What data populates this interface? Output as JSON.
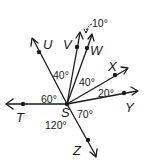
{
  "diagram": {
    "type": "angles-from-common-vertex",
    "vertex": {
      "label": "S",
      "x": 67,
      "y": 104
    },
    "rays": [
      {
        "name": "T",
        "dot": [
          23,
          104
        ],
        "tip": [
          6,
          104
        ],
        "label_pos": [
          17,
          122
        ]
      },
      {
        "name": "U",
        "dot": [
          39,
          52
        ],
        "tip": [
          32,
          38
        ],
        "label_pos": [
          44,
          48
        ]
      },
      {
        "name": "V",
        "dot": [
          77,
          47
        ],
        "tip": [
          80,
          32
        ],
        "label_pos": [
          63,
          48
        ]
      },
      {
        "name": "W",
        "dot": [
          87,
          48
        ],
        "tip": [
          92,
          34
        ],
        "label_pos": [
          90,
          55
        ]
      },
      {
        "name": "X",
        "dot": [
          115,
          75
        ],
        "tip": [
          128,
          68
        ],
        "label_pos": [
          108,
          71
        ]
      },
      {
        "name": "Y",
        "dot": [
          124,
          93
        ],
        "tip": [
          138,
          91
        ],
        "label_pos": [
          124,
          112
        ]
      },
      {
        "name": "Z",
        "dot": [
          88,
          140
        ],
        "tip": [
          96,
          157
        ],
        "label_pos": [
          73,
          155
        ]
      }
    ],
    "angles": [
      {
        "value": "60°",
        "between": [
          "T",
          "U"
        ],
        "pos": [
          41,
          102
        ]
      },
      {
        "value": "40°",
        "between": [
          "U",
          "V"
        ],
        "pos": [
          53,
          79
        ]
      },
      {
        "value": "10°",
        "between": [
          "V",
          "W"
        ],
        "pos": [
          92,
          28
        ]
      },
      {
        "value": "40°",
        "between": [
          "W",
          "X"
        ],
        "pos": [
          79,
          87
        ]
      },
      {
        "value": "20°",
        "between": [
          "X",
          "Y"
        ],
        "pos": [
          98,
          97
        ]
      },
      {
        "value": "70°",
        "between": [
          "Y",
          "Z"
        ],
        "pos": [
          77,
          117
        ]
      },
      {
        "value": "120°",
        "between": [
          "Z",
          "T"
        ],
        "pos": [
          45,
          128
        ]
      }
    ],
    "labels": {
      "S": "S",
      "T": "T",
      "U": "U",
      "V": "V",
      "W": "W",
      "X": "X",
      "Y": "Y",
      "Z": "Z"
    }
  }
}
